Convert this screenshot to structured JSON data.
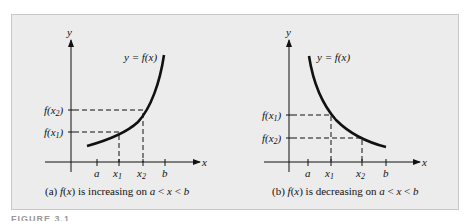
{
  "figure_label": "FIGURE 3.1",
  "panels": [
    {
      "id": "a",
      "caption": "(a) f(x) is increasing on a < x < b",
      "curve_label": "y = f(x)",
      "y_axis_label": "y",
      "x_axis_label": "x",
      "x_ticks": [
        "a",
        "x1",
        "x2",
        "b"
      ],
      "y_ticks": [
        "f(x2)",
        "f(x1)"
      ],
      "behavior": "increasing"
    },
    {
      "id": "b",
      "caption": "(b) f(x) is decreasing on a < x < b",
      "curve_label": "y = f(x)",
      "y_axis_label": "y",
      "x_axis_label": "x",
      "x_ticks": [
        "a",
        "x1",
        "x2",
        "b"
      ],
      "y_ticks": [
        "f(x1)",
        "f(x2)"
      ],
      "behavior": "decreasing"
    }
  ],
  "colors": {
    "background": "#ececec",
    "stroke": "#111111"
  }
}
